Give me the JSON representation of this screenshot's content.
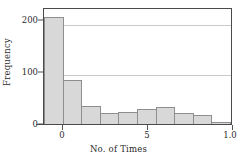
{
  "chart_data": {
    "type": "bar",
    "title": "",
    "subtitle": "",
    "xlabel": "No. of Times",
    "ylabel": "Frequency",
    "categories": [
      "0",
      "1",
      "2",
      "3",
      "4",
      "5",
      "6",
      "7",
      "8",
      "9"
    ],
    "values": [
      216,
      88,
      37,
      23,
      25,
      31,
      35,
      23,
      19,
      5
    ],
    "series": [
      {
        "name": "Frequency",
        "values": [
          216,
          88,
          37,
          23,
          25,
          31,
          35,
          23,
          19,
          5
        ]
      }
    ],
    "xlim": [
      -0.5,
      10
    ],
    "ylim": [
      0,
      232
    ],
    "yticks": [
      0,
      100,
      200
    ],
    "ytick_labels": [
      "0",
      "100",
      "200"
    ],
    "xticks": [
      0,
      5,
      10
    ],
    "xtick_labels": [
      "0",
      "5",
      "1.0"
    ],
    "grid": true,
    "grid_axis": "y",
    "legend": false,
    "legend_position": "none",
    "bar_fill_color": "#d8d8d8",
    "bar_edge_color": "#8e8e8e",
    "grid_color": "#c9c9c9",
    "axis_color": "#4a4a4a",
    "background_color": "#ffffff"
  }
}
